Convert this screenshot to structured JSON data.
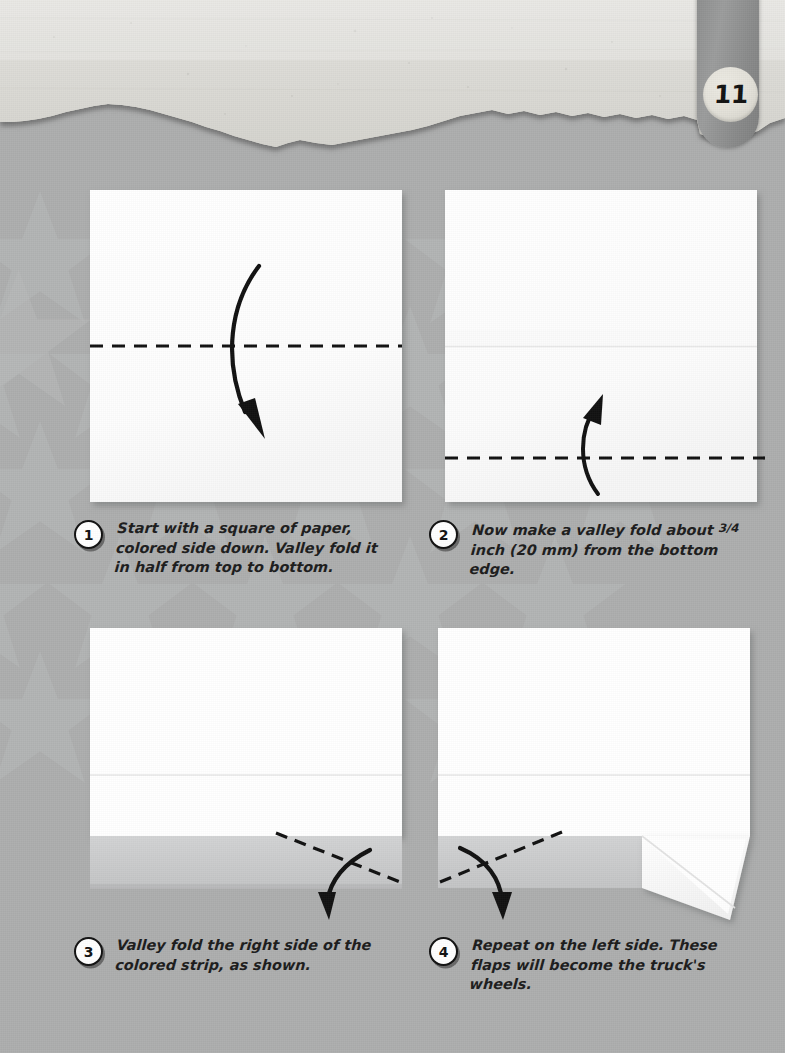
{
  "page": {
    "number": "11",
    "background_color": "#adaeae",
    "star_color": "#b7b8b8",
    "header_paper_color": "#d9d9d6",
    "paper_white": "#ffffff",
    "colored_strip": "#c9cacb",
    "fold_line_color": "#111111",
    "arrow_color": "#111111"
  },
  "steps": [
    {
      "number": "1",
      "text": "Start with a square of paper, colored side down. Valley fold it in half from top to bottom.",
      "diagram": {
        "name": "square-sheet-horizontal-valley-fold",
        "shape": "square",
        "fold_lines": [
          "horizontal-center-dashed"
        ],
        "arrow": "curved-down"
      }
    },
    {
      "number": "2",
      "text_before_fraction": "Now make a valley fold about ",
      "fraction": "3/4",
      "text_after_fraction": " inch (20 mm) from the bottom edge.",
      "text": "Now make a valley fold about 3/4 inch (20 mm) from the bottom edge.",
      "diagram": {
        "name": "square-sheet-bottom-valley-fold",
        "shape": "square",
        "fold_lines": [
          "horizontal-center-crease",
          "horizontal-near-bottom-dashed"
        ],
        "arrow": "curved-up"
      }
    },
    {
      "number": "3",
      "text": "Valley fold the right side of the colored strip, as shown.",
      "diagram": {
        "name": "folded-sheet-right-flap-fold",
        "shape": "rectangle-with-bottom-strip",
        "fold_lines": [
          "diagonal-right-dashed"
        ],
        "arrow": "curved-down-right"
      }
    },
    {
      "number": "4",
      "text": "Repeat on the left side. These flaps will become the truck's wheels.",
      "diagram": {
        "name": "folded-sheet-left-flap-fold",
        "shape": "rectangle-with-bottom-strip-and-folded-flap",
        "fold_lines": [
          "diagonal-left-dashed"
        ],
        "arrow": "curved-down-left"
      }
    }
  ]
}
